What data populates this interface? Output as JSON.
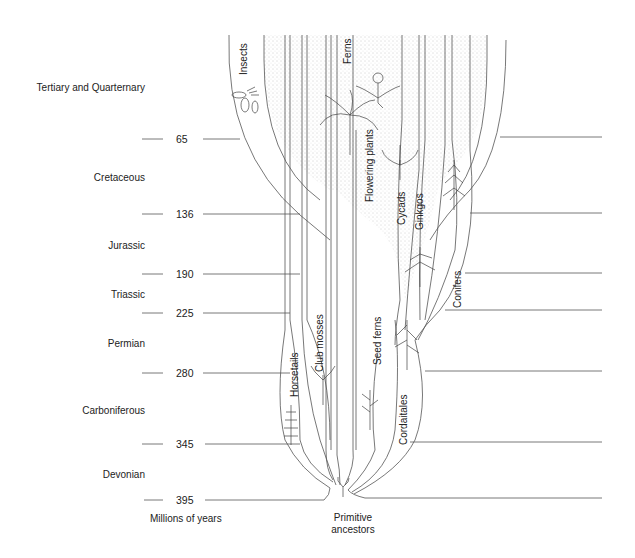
{
  "diagram": {
    "type": "phylogenetic-timescale",
    "axis_title": "Millions of years",
    "root_label": "Primitive ancestors",
    "periods": [
      {
        "name": "Tertiary and Quarternary",
        "y": 87
      },
      {
        "name": "Cretaceous",
        "y": 177
      },
      {
        "name": "Jurassic",
        "y": 245
      },
      {
        "name": "Triassic",
        "y": 294
      },
      {
        "name": "Permian",
        "y": 343
      },
      {
        "name": "Carboniferous",
        "y": 410
      },
      {
        "name": "Devonian",
        "y": 474
      }
    ],
    "ages": [
      {
        "value": "65",
        "y": 139
      },
      {
        "value": "136",
        "y": 214
      },
      {
        "value": "190",
        "y": 274
      },
      {
        "value": "225",
        "y": 313
      },
      {
        "value": "280",
        "y": 373
      },
      {
        "value": "345",
        "y": 444
      },
      {
        "value": "395",
        "y": 500
      }
    ],
    "lineages": [
      {
        "name": "Insects",
        "x": 238,
        "y": 70
      },
      {
        "name": "Horsetails",
        "x": 289,
        "y": 397
      },
      {
        "name": "Club mosses",
        "x": 319,
        "y": 367
      },
      {
        "name": "Ferns",
        "x": 345,
        "y": 63
      },
      {
        "name": "Flowering plants",
        "x": 374,
        "y": 200
      },
      {
        "name": "Seed ferns",
        "x": 381,
        "y": 377
      },
      {
        "name": "Cycads",
        "x": 406,
        "y": 228
      },
      {
        "name": "Ginkgos",
        "x": 424,
        "y": 232
      },
      {
        "name": "Conifers",
        "x": 462,
        "y": 305
      },
      {
        "name": "Cordaitales",
        "x": 404,
        "y": 445
      }
    ],
    "colors": {
      "line": "#555555",
      "stipple": "#c8c8c8",
      "text": "#222222",
      "background": "#ffffff"
    }
  }
}
